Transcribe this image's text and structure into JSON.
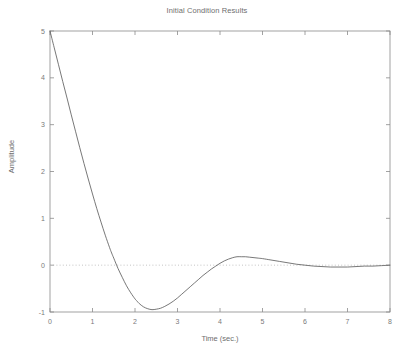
{
  "chart_data": {
    "type": "line",
    "title": "Initial Condition Results",
    "xlabel": "Time (sec.)",
    "ylabel": "Amplitude",
    "xlim": [
      0,
      8
    ],
    "ylim": [
      -1,
      5
    ],
    "xticks": [
      0,
      1,
      2,
      3,
      4,
      5,
      6,
      7,
      8
    ],
    "xtick_labels": [
      "0",
      "1",
      "2",
      "3",
      "4",
      "5",
      "6",
      "7",
      "8"
    ],
    "yticks": [
      -1,
      0,
      1,
      2,
      3,
      4,
      5
    ],
    "ytick_labels": [
      "-1",
      "0",
      "1",
      "2",
      "3",
      "4",
      "5"
    ],
    "grid": false,
    "legend": null,
    "reference_lines": [
      {
        "name": "zero-line",
        "orientation": "horizontal",
        "value": 0,
        "style": "dotted",
        "color": "#bdbdbd"
      }
    ],
    "series": [
      {
        "name": "amplitude-response",
        "color": "#555555",
        "line_width": 0.8,
        "x": [
          0.0,
          0.1,
          0.2,
          0.3,
          0.4,
          0.5,
          0.6,
          0.7,
          0.8,
          0.9,
          1.0,
          1.1,
          1.2,
          1.3,
          1.4,
          1.45,
          1.5,
          1.6,
          1.7,
          1.8,
          1.9,
          2.0,
          2.05,
          2.1,
          2.2,
          2.3,
          2.4,
          2.5,
          2.6,
          2.7,
          2.8,
          2.9,
          3.0,
          3.1,
          3.2,
          3.3,
          3.4,
          3.5,
          3.6,
          3.7,
          3.8,
          3.9,
          4.0,
          4.1,
          4.2,
          4.3,
          4.4,
          4.5,
          4.6,
          4.7,
          4.8,
          4.9,
          5.0,
          5.2,
          5.4,
          5.6,
          5.8,
          6.0,
          6.2,
          6.4,
          6.6,
          6.8,
          7.0,
          7.2,
          7.4,
          7.6,
          7.8,
          8.0
        ],
        "y": [
          5.0,
          4.64,
          4.28,
          3.92,
          3.57,
          3.21,
          2.86,
          2.51,
          2.17,
          1.84,
          1.52,
          1.21,
          0.92,
          0.64,
          0.38,
          0.26,
          0.15,
          -0.07,
          -0.26,
          -0.44,
          -0.59,
          -0.72,
          -0.77,
          -0.82,
          -0.89,
          -0.93,
          -0.95,
          -0.94,
          -0.92,
          -0.88,
          -0.83,
          -0.77,
          -0.7,
          -0.62,
          -0.54,
          -0.46,
          -0.38,
          -0.3,
          -0.22,
          -0.15,
          -0.08,
          -0.02,
          0.04,
          0.09,
          0.13,
          0.16,
          0.18,
          0.18,
          0.18,
          0.17,
          0.16,
          0.15,
          0.14,
          0.11,
          0.08,
          0.05,
          0.02,
          0.0,
          -0.02,
          -0.03,
          -0.04,
          -0.04,
          -0.04,
          -0.03,
          -0.02,
          -0.02,
          -0.01,
          0.0
        ],
        "annotations": {
          "initial_value": 5.0,
          "first_zero_crossing": 1.45,
          "minimum": {
            "x": 2.05,
            "y": -0.95
          },
          "overshoot_peak": {
            "x": 4.35,
            "y": 0.18
          },
          "settling_value": 0.0
        }
      }
    ]
  },
  "figure": {
    "background_color": "#ffffff",
    "axis_color": "#888888",
    "text_color": "#6e6e6e",
    "caption_fragment": ""
  }
}
